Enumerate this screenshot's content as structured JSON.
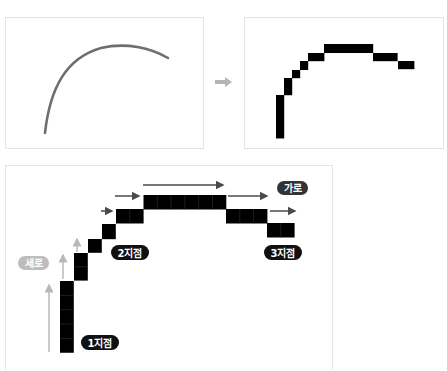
{
  "diagram": {
    "colors": {
      "curve": "#6e6e6e",
      "pixel": "#000000",
      "transition_arrow": "#b5b5b5",
      "vertical_arrow": "#b8b8b8",
      "horizontal_arrow": "#4a4a4a",
      "label_dark_bg": "#111111",
      "label_grey_bg": "#bdbdbd",
      "panel_border": "#e4e4e4"
    },
    "panels": {
      "curve": {
        "name": "smooth-curve",
        "icon": "curve"
      },
      "transition": {
        "icon": "arrow-right-icon"
      },
      "pixels": {
        "name": "pixelated-curve"
      },
      "steps": {
        "name": "step-explanation"
      }
    },
    "labels": {
      "vertical": "세로",
      "horizontal": "가로",
      "point1": "1지점",
      "point2": "2지점",
      "point3": "3지점"
    },
    "pixel_runs": [
      {
        "orientation": "vertical",
        "length": 5
      },
      {
        "orientation": "vertical",
        "length": 2
      },
      {
        "orientation": "single",
        "length": 1
      },
      {
        "orientation": "single",
        "length": 1
      },
      {
        "orientation": "horizontal",
        "length": 2
      },
      {
        "orientation": "horizontal",
        "length": 6
      },
      {
        "orientation": "horizontal",
        "length": 3
      },
      {
        "orientation": "horizontal",
        "length": 2
      }
    ]
  }
}
